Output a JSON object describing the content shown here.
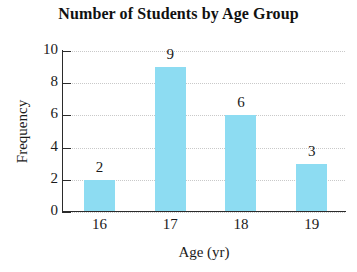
{
  "chart_data": {
    "type": "bar",
    "title": "Number of Students by Age Group",
    "xlabel": "Age (yr)",
    "ylabel": "Frequency",
    "categories": [
      "16",
      "17",
      "18",
      "19"
    ],
    "values": [
      2,
      9,
      6,
      3
    ],
    "value_labels": [
      "2",
      "9",
      "6",
      "3"
    ],
    "ylim": [
      0,
      10
    ],
    "ytick_labels": [
      "0",
      "2",
      "4",
      "6",
      "8",
      "10"
    ],
    "ytick_values": [
      0,
      2,
      4,
      6,
      8,
      10
    ],
    "grid": "horizontal-dotted",
    "legend": "none",
    "bar_color": "#8ddcf2",
    "axis_color": "#2b2b2b",
    "gridline_color": "#c9c9c9",
    "background_color": "#ffffff"
  }
}
